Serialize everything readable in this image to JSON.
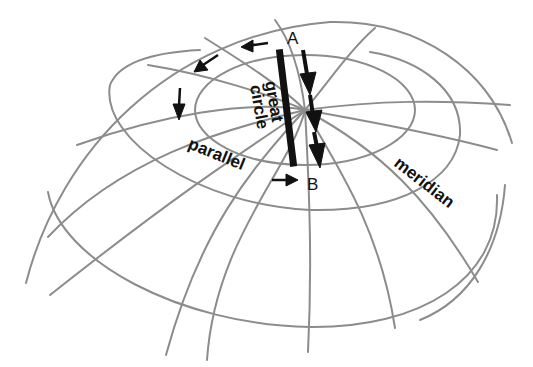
{
  "figure": {
    "title": "",
    "labels": {
      "point_a": "A",
      "point_b": "B",
      "great_circle_1": "great",
      "great_circle_2": "circle",
      "parallel": "parallel",
      "meridian": "meridian"
    },
    "colors": {
      "grid": "#8c8c8c",
      "ink": "#111111",
      "background": "#ffffff"
    }
  }
}
